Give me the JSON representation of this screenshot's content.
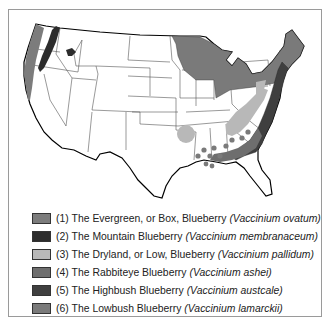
{
  "map": {
    "subject": "Native ranges of blueberry species in the contiguous United States",
    "region": "Contiguous United States",
    "colors": {
      "evergreen": "#7c7c7c",
      "mountain": "#2c2c2c",
      "dryland": "#b8b8b8",
      "rabbiteye": "#6e6e6e",
      "highbush": "#3f3f3f",
      "lowbush": "#7a7a7a",
      "state_line": "#555555",
      "coast_line": "#000000"
    }
  },
  "legend": {
    "items": [
      {
        "number": "(1)",
        "common": "The Evergreen, or Box, Blueberry",
        "scientific": "(Vaccinium ovatum)",
        "color": "#7c7c7c"
      },
      {
        "number": "(2)",
        "common": "The Mountain Blueberry",
        "scientific": "(Vaccinium membranaceum)",
        "color": "#2c2c2c"
      },
      {
        "number": "(3)",
        "common": "The Dryland, or Low, Blueberry",
        "scientific": "(Vaccinium pallidum)",
        "color": "#b8b8b8"
      },
      {
        "number": "(4)",
        "common": "The Rabbiteye Blueberry",
        "scientific": "(Vaccinium ashei)",
        "color": "#6e6e6e"
      },
      {
        "number": "(5)",
        "common": "The Highbush Blueberry",
        "scientific": "(Vaccinium austcale)",
        "color": "#3f3f3f"
      },
      {
        "number": "(6)",
        "common": "The Lowbush Blueberry",
        "scientific": "(Vaccinium lamarckii)",
        "color": "#7a7a7a"
      }
    ]
  }
}
